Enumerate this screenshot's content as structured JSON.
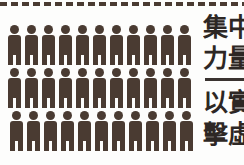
{
  "page": {
    "background_color": "#fdfdfc",
    "ink_color": "#4a3b32",
    "text_color": "#2d2724"
  },
  "perforation": {
    "name": "dashed-cut-line",
    "dash_count": 23
  },
  "pictogram": {
    "icon_name": "person-figure-icon",
    "fill_color": "#4a3b32",
    "rows": [
      {
        "label": "row-1",
        "count": 11
      },
      {
        "label": "row-2",
        "count": 11
      },
      {
        "label": "row-3",
        "count": 11
      }
    ],
    "total": 33
  },
  "caption": {
    "upper": {
      "lines": [
        "集中",
        "力量"
      ],
      "full_text": "集中力量"
    },
    "divider": {
      "name": "caption-divider-rule",
      "color": "#3a3330"
    },
    "lower": {
      "lines": [
        "以實",
        "擊虛"
      ],
      "full_text": "以實擊虛"
    }
  }
}
